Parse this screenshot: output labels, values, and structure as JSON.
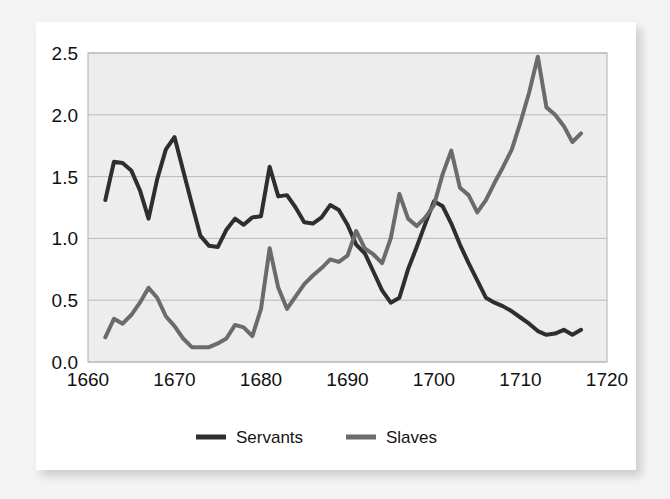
{
  "page": {
    "background_color": "#f3f3f3",
    "card_color": "#ffffff"
  },
  "chart_data": {
    "type": "line",
    "title": "",
    "subtitle": "",
    "xlabel": "",
    "ylabel": "",
    "xlim": [
      1660,
      1720
    ],
    "ylim": [
      0.0,
      2.5
    ],
    "grid": true,
    "grid_axis": "y",
    "legend_position": "bottom",
    "plot_background": "#ededed",
    "x_ticks": [
      1660,
      1670,
      1680,
      1690,
      1700,
      1710,
      1720
    ],
    "x_tick_labels": [
      "1660",
      "1670",
      "1680",
      "1690",
      "1700",
      "1710",
      "1720"
    ],
    "y_ticks": [
      0.0,
      0.5,
      1.0,
      1.5,
      2.0,
      2.5
    ],
    "y_tick_labels": [
      "0.0",
      "0.5",
      "1.0",
      "1.5",
      "2.0",
      "2.5"
    ],
    "series": [
      {
        "name": "Servants",
        "color": "#2e2e2e",
        "line_width": 4.0,
        "x": [
          1662,
          1663,
          1664,
          1665,
          1666,
          1667,
          1668,
          1669,
          1670,
          1671,
          1672,
          1673,
          1674,
          1675,
          1676,
          1677,
          1678,
          1679,
          1680,
          1681,
          1682,
          1683,
          1684,
          1685,
          1686,
          1687,
          1688,
          1689,
          1690,
          1691,
          1692,
          1693,
          1694,
          1695,
          1696,
          1697,
          1698,
          1699,
          1700,
          1701,
          1702,
          1703,
          1704,
          1705,
          1706,
          1707,
          1708,
          1709,
          1710,
          1711,
          1712,
          1713,
          1714,
          1715,
          1716,
          1717
        ],
        "values": [
          1.31,
          1.62,
          1.61,
          1.55,
          1.39,
          1.16,
          1.48,
          1.72,
          1.82,
          1.55,
          1.28,
          1.02,
          0.94,
          0.93,
          1.07,
          1.16,
          1.11,
          1.17,
          1.18,
          1.58,
          1.34,
          1.35,
          1.25,
          1.13,
          1.12,
          1.17,
          1.27,
          1.23,
          1.11,
          0.95,
          0.88,
          0.73,
          0.58,
          0.48,
          0.52,
          0.75,
          0.93,
          1.12,
          1.3,
          1.26,
          1.12,
          0.95,
          0.8,
          0.66,
          0.52,
          0.48,
          0.45,
          0.41,
          0.36,
          0.31,
          0.25,
          0.22,
          0.23,
          0.26,
          0.22,
          0.26
        ]
      },
      {
        "name": "Slaves",
        "color": "#6b6b6b",
        "line_width": 4.0,
        "x": [
          1662,
          1663,
          1664,
          1665,
          1666,
          1667,
          1668,
          1669,
          1670,
          1671,
          1672,
          1673,
          1674,
          1675,
          1676,
          1677,
          1678,
          1679,
          1680,
          1681,
          1682,
          1683,
          1684,
          1685,
          1686,
          1687,
          1688,
          1689,
          1690,
          1691,
          1692,
          1693,
          1694,
          1695,
          1696,
          1697,
          1698,
          1699,
          1700,
          1701,
          1702,
          1703,
          1704,
          1705,
          1706,
          1707,
          1708,
          1709,
          1710,
          1711,
          1712,
          1713,
          1714,
          1715,
          1716,
          1717
        ],
        "values": [
          0.2,
          0.35,
          0.31,
          0.38,
          0.48,
          0.6,
          0.52,
          0.37,
          0.29,
          0.19,
          0.12,
          0.12,
          0.12,
          0.15,
          0.19,
          0.3,
          0.28,
          0.21,
          0.43,
          0.92,
          0.6,
          0.43,
          0.53,
          0.63,
          0.7,
          0.76,
          0.83,
          0.81,
          0.86,
          1.06,
          0.92,
          0.87,
          0.8,
          1.0,
          1.36,
          1.16,
          1.1,
          1.17,
          1.27,
          1.52,
          1.71,
          1.41,
          1.35,
          1.21,
          1.31,
          1.45,
          1.58,
          1.72,
          1.94,
          2.18,
          2.47,
          2.06,
          2.0,
          1.91,
          1.78,
          1.85
        ]
      }
    ]
  },
  "legend": {
    "entries": [
      {
        "label": "Servants",
        "color": "#2e2e2e"
      },
      {
        "label": "Slaves",
        "color": "#6b6b6b"
      }
    ]
  }
}
